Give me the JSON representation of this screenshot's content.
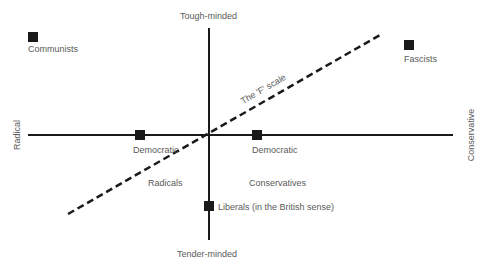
{
  "diagram": {
    "axes": {
      "top": "Tough-minded",
      "bottom": "Tender-minded",
      "left": "Radical",
      "right": "Conservative"
    },
    "scale_line_label": "The 'F' scale",
    "points": [
      {
        "label": "Communists"
      },
      {
        "label": "Fascists"
      },
      {
        "label": "Democratic"
      },
      {
        "label": "Democratic"
      },
      {
        "label": "Liberals (in the British sense)"
      }
    ],
    "region_labels": {
      "radicals": "Radicals",
      "conservatives": "Conservatives"
    },
    "colors": {
      "lines": "#1a1a1a",
      "text": "#5a5a5a",
      "background": "#ffffff"
    }
  }
}
